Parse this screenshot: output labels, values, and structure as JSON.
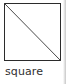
{
  "figure": {
    "caption": "square",
    "shape_name": "square",
    "diagram_kind": "geometric-shape-with-diagonal",
    "stroke_color": "#2b2b2b",
    "diagonal_color": "#4a4a4a",
    "fill_color": "#ffffff",
    "background_color": "#ffffff",
    "caption_color": "#303030",
    "outline": {
      "x": 0.5,
      "y": 0.5,
      "width": 56,
      "height": 57
    },
    "diagonal": {
      "from": "top-left",
      "to": "bottom-right",
      "x1": 0.5,
      "y1": 0.5,
      "x2": 56.5,
      "y2": 57.5
    }
  }
}
